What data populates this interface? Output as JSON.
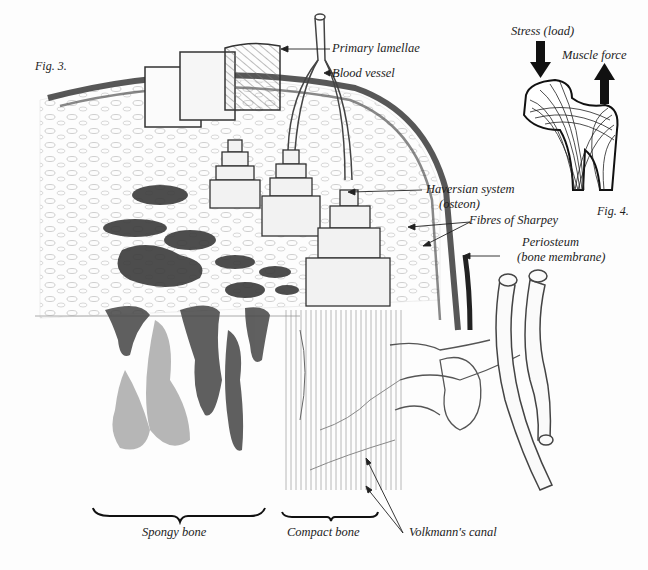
{
  "figures": {
    "fig3": {
      "caption": "Fig. 3.",
      "labels": {
        "primary_lamellae": "Primary lamellae",
        "blood_vessel": "Blood vessel",
        "haversian_system": "Haversian system",
        "haversian_system_sub": "(osteon)",
        "fibres_of_sharpey": "Fibres of Sharpey",
        "periosteum": "Periosteum",
        "periosteum_sub": "(bone membrane)",
        "volkmanns_canal": "Volkmann's canal",
        "spongy_bone": "Spongy bone",
        "compact_bone": "Compact bone"
      }
    },
    "fig4": {
      "caption": "Fig. 4.",
      "labels": {
        "stress_load": "Stress (load)",
        "muscle_force": "Muscle force"
      }
    }
  },
  "colors": {
    "ink": "#1a1a1a",
    "pencil_dark": "#2e2e2e",
    "pencil_mid": "#7a7a7a",
    "pencil_light": "#c4c4c4",
    "paper": "#fdfdfd"
  }
}
